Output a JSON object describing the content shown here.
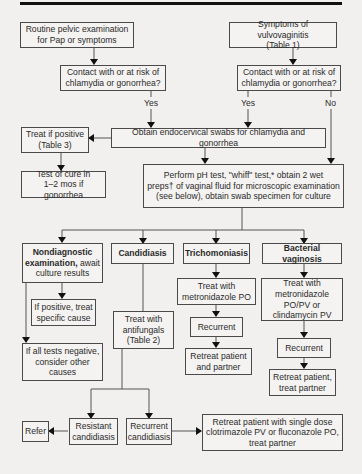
{
  "diagram": {
    "type": "flowchart",
    "nodes": {
      "routine": "Routine pelvic examination\nfor Pap or symptoms",
      "symptoms": "Symptoms of vulvovaginitis\n(Table 1)",
      "contact_left": "Contact with or at risk of\nchlamydia or gonorrhea?",
      "contact_right": "Contact with or at risk of\nchlamydia or gonorrhea?",
      "treat_if_positive": "Treat if positive\n(Table 3)",
      "obtain_swabs": "Obtain endocervical swabs for chlamydia and gonorrhea",
      "test_of_cure": "Test of cure in\n1–2 mos if gonorrhea",
      "perform_tests": "Perform pH test, \"whiff\" test,* obtain 2 wet\npreps† of vaginal fluid for microscopic examination\n(see below), obtain swab specimen for culture",
      "nondiagnostic_bold": "Nondiagnostic\nexamination,",
      "nondiagnostic_rest": " await\nculture results",
      "candidiasis": "Candidiasis",
      "trichomoniasis": "Trichomoniasis",
      "bacterial_vaginosis": "Bacterial vaginosis",
      "if_positive": "If positive, treat\nspecific cause",
      "if_all_negative": "If all tests negative,\nconsider other\ncauses",
      "treat_antifungals": "Treat with\nantifungals\n(Table 2)",
      "treat_metronidazole_po": "Treat with\nmetronidazole PO",
      "treat_bv": "Treat with\nmetronidazole\nPO/PV or\nclindamycin PV",
      "tricho_recurrent": "Recurrent",
      "bv_recurrent": "Recurrent",
      "retreat_patient_partner": "Retreat patient\nand partner",
      "retreat_patient_treat_partner": "Retreat patient,\ntreat partner",
      "refer": "Refer",
      "resistant_candidiasis": "Resistant\ncandidiasis",
      "recurrent_candidiasis": "Recurrent\ncandidiasis",
      "retreat_single_dose": "Retreat patient with single dose\nclotrimazole PV or fluconazole PO,\ntreat partner"
    },
    "edge_labels": {
      "yes_left": "Yes",
      "yes_right": "Yes",
      "no_right": "No"
    }
  }
}
